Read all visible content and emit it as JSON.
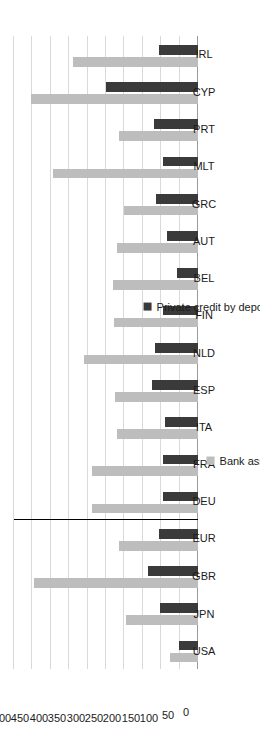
{
  "chart_data": {
    "type": "bar",
    "orientation": "horizontal",
    "title": "",
    "xlabel": "",
    "ylabel": "",
    "ylim": [
      0,
      500
    ],
    "yticks": [
      0,
      50,
      100,
      150,
      200,
      250,
      300,
      350,
      400,
      450,
      500
    ],
    "grid": true,
    "legend_position": "bottom",
    "categories": [
      "USA",
      "JPN",
      "GBR",
      "EUR",
      "DEU",
      "FRA",
      "ITA",
      "ESP",
      "NLD",
      "FIN",
      "BEL",
      "AUT",
      "GRC",
      "MLT",
      "PRT",
      "CYP",
      "IRL"
    ],
    "series": [
      {
        "name": "Bank assets",
        "color": "#bdbdbd",
        "values": [
          75,
          195,
          445,
          215,
          287,
          220,
          225,
          310,
          228,
          230,
          220,
          200,
          395,
          215,
          455,
          340,
          0
        ]
      },
      {
        "name": "Private credit by deposit money banks",
        "color": "#3a3a3a",
        "values": [
          52,
          102,
          137,
          105,
          95,
          90,
          125,
          118,
          95,
          57,
          83,
          115,
          95,
          120,
          250,
          105,
          0
        ]
      }
    ],
    "series_ordered": [
      {
        "name": "Bank assets",
        "color": "#bdbdbd",
        "data": {
          "USA": 75,
          "JPN": 195,
          "GBR": 445,
          "EUR": 215,
          "DEU": 287,
          "FRA": 287,
          "ITA": 220,
          "ESP": 225,
          "NLD": 310,
          "FIN": 228,
          "BEL": 230,
          "AUT": 220,
          "GRC": 200,
          "MLT": 395,
          "PRT": 215,
          "CYP": 455,
          "IRL": 340
        }
      },
      {
        "name": "Private credit by deposit money banks",
        "color": "#3a3a3a",
        "data": {
          "USA": 52,
          "JPN": 102,
          "GBR": 137,
          "EUR": 105,
          "DEU": 95,
          "FRA": 95,
          "ITA": 90,
          "ESP": 125,
          "NLD": 118,
          "FIN": 95,
          "BEL": 57,
          "AUT": 83,
          "GRC": 115,
          "MLT": 95,
          "PRT": 120,
          "CYP": 250,
          "IRL": 105
        }
      }
    ],
    "separator_after_category": "EUR",
    "notes": ""
  },
  "legend": {
    "items": [
      {
        "label": "Bank assets",
        "color": "#bdbdbd"
      },
      {
        "label": "Private credit by deposit money banks",
        "color": "#3a3a3a"
      }
    ]
  },
  "axis": {
    "tick_labels": [
      "0",
      "50",
      "100",
      "150",
      "200",
      "250",
      "300",
      "350",
      "400",
      "450",
      "500"
    ]
  },
  "colors": {
    "bank_assets": "#bdbdbd",
    "private_credit": "#3a3a3a",
    "gridline": "#d9d9d9",
    "axis": "#9a9a9a",
    "separator": "#000000",
    "text": "#1a1a1a",
    "background": "#ffffff"
  }
}
